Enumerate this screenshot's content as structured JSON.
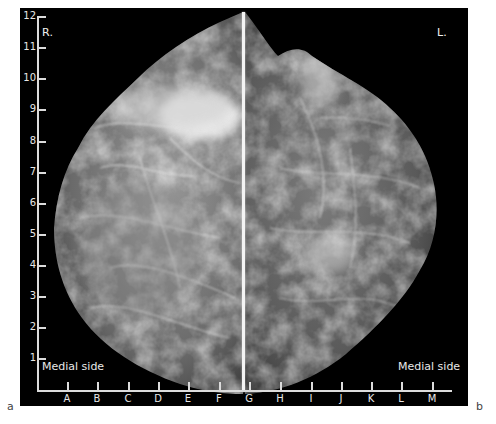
{
  "figure": {
    "panel_labels": {
      "left": "a",
      "right": "b"
    },
    "sides": {
      "right_breast": "R.",
      "left_breast": "L."
    },
    "annotations": {
      "medial_left": "Medial side",
      "medial_right": "Medial side"
    },
    "y_axis": {
      "ticks": [
        "1",
        "2",
        "3",
        "4",
        "5",
        "6",
        "7",
        "8",
        "9",
        "10",
        "11",
        "12"
      ]
    },
    "x_axis": {
      "ticks": [
        "A",
        "B",
        "C",
        "D",
        "E",
        "F",
        "G",
        "H",
        "I",
        "J",
        "K",
        "L",
        "M"
      ]
    },
    "colors": {
      "background": "#ffffff",
      "panel": "#000000",
      "axis": "#dcdcdc",
      "text": "#e8e8e8",
      "divider": "#f4f4f4"
    }
  }
}
